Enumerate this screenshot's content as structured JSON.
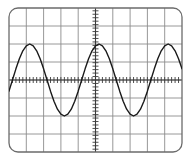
{
  "app": {
    "title": "Oscilloscope Display",
    "screen_name": "oscilloscope-graticule"
  },
  "display": {
    "background_color": "#ffffff",
    "frame_color": "#6b6b6b",
    "frame_corner_radius": 9,
    "frame": {
      "x": 9,
      "y": 8,
      "width": 173,
      "height": 144
    },
    "grid_color": "#8c8c8c",
    "axis_color": "#3b3b3b",
    "trace_color": "#1a1a1a",
    "trace_width": 1.4,
    "horizontal_divisions": 10,
    "vertical_divisions": 8,
    "tick_spacing_px": 3.46,
    "tick_length_px": 3,
    "center_x": 95.5,
    "center_y": 80
  },
  "chart_data": {
    "type": "line",
    "title": "",
    "subtitle": "",
    "xlabel": "",
    "ylabel": "",
    "grid": true,
    "legend": null,
    "annotations": [],
    "waveform": "sine",
    "amplitude_divisions": 2.0,
    "periods_visible": 2.5,
    "phase_degrees": 0,
    "offset_divisions": 0,
    "xlim": [
      -5,
      5
    ],
    "ylim": [
      -4,
      4
    ],
    "xtick_labels": [],
    "ytick_labels": [],
    "peaks_px": [
      {
        "x": 23,
        "y": 42
      },
      {
        "x": 95,
        "y": 42
      },
      {
        "x": 167,
        "y": 42
      }
    ],
    "troughs_px": [
      {
        "x": 59,
        "y": 118
      },
      {
        "x": 131,
        "y": 118
      }
    ],
    "zero_crossings_px": [
      5,
      41,
      77,
      113,
      149,
      185
    ],
    "series": [
      {
        "name": "channel-1",
        "color": "#1a1a1a",
        "x": [
          -5.0,
          -4.8,
          -4.6,
          -4.4,
          -4.2,
          -4.0,
          -3.8,
          -3.6,
          -3.4,
          -3.2,
          -3.0,
          -2.8,
          -2.6,
          -2.4,
          -2.2,
          -2.0,
          -1.8,
          -1.6,
          -1.4,
          -1.2,
          -1.0,
          -0.8,
          -0.6,
          -0.4,
          -0.2,
          0.0,
          0.2,
          0.4,
          0.6,
          0.8,
          1.0,
          1.2,
          1.4,
          1.6,
          1.8,
          2.0,
          2.2,
          2.4,
          2.6,
          2.8,
          3.0,
          3.2,
          3.4,
          3.6,
          3.8,
          4.0,
          4.2,
          4.4,
          4.6,
          4.8,
          5.0
        ],
        "values": [
          -0.62,
          0.0,
          0.62,
          1.18,
          1.62,
          1.9,
          2.0,
          1.9,
          1.62,
          1.18,
          0.62,
          0.0,
          -0.62,
          -1.18,
          -1.62,
          -1.9,
          -2.0,
          -1.9,
          -1.62,
          -1.18,
          -0.62,
          0.0,
          0.62,
          1.18,
          1.62,
          1.9,
          2.0,
          1.9,
          1.62,
          1.18,
          0.62,
          0.0,
          -0.62,
          -1.18,
          -1.62,
          -1.9,
          -2.0,
          -1.9,
          -1.62,
          -1.18,
          -0.62,
          0.0,
          0.62,
          1.18,
          1.62,
          1.9,
          2.0,
          1.9,
          1.62,
          1.18,
          0.62
        ]
      }
    ]
  }
}
